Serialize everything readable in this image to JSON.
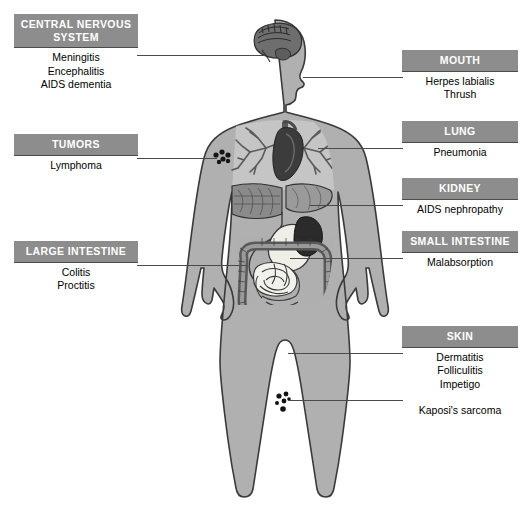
{
  "diagram": {
    "colors": {
      "header_bg": "#8d8d8d",
      "header_text": "#ffffff",
      "line": "#4a4a4a",
      "body_fill": "#b0b0b0",
      "body_outline": "#3a3a3a",
      "organ_dark": "#3c3c3c",
      "organ_mid": "#6e6e6e",
      "organ_light": "#d8d8d8",
      "background": "#ffffff"
    },
    "figure": {
      "name": "human-body-anterior-view",
      "markers": [
        {
          "name": "lymph-node-cluster",
          "label": "Lymphoma nodes",
          "region": "left axilla"
        },
        {
          "name": "kaposi-lesions",
          "label": "Kaposi's sarcoma lesions",
          "region": "right lower leg"
        }
      ],
      "organs": [
        "brain",
        "lungs",
        "bronchi",
        "heart",
        "liver",
        "stomach",
        "kidney",
        "small-intestine",
        "large-intestine",
        "bladder"
      ]
    },
    "callouts": [
      {
        "id": "cns",
        "header": "CENTRAL NERVOUS SYSTEM",
        "items": [
          "Meningitis",
          "Encephalitis",
          "AIDS dementia"
        ],
        "side": "left",
        "target": "brain"
      },
      {
        "id": "tumors",
        "header": "TUMORS",
        "items": [
          "Lymphoma"
        ],
        "side": "left",
        "target": "axillary-lymph-nodes"
      },
      {
        "id": "large-intestine",
        "header": "LARGE INTESTINE",
        "items": [
          "Colitis",
          "Proctitis"
        ],
        "side": "left",
        "target": "colon"
      },
      {
        "id": "mouth",
        "header": "MOUTH",
        "items": [
          "Herpes labialis",
          "Thrush"
        ],
        "side": "right",
        "target": "mouth"
      },
      {
        "id": "lung",
        "header": "LUNG",
        "items": [
          "Pneumonia"
        ],
        "side": "right",
        "target": "lung"
      },
      {
        "id": "kidney",
        "header": "KIDNEY",
        "items": [
          "AIDS nephropathy"
        ],
        "side": "right",
        "target": "kidney"
      },
      {
        "id": "small-intestine",
        "header": "SMALL INTESTINE",
        "items": [
          "Malabsorption"
        ],
        "side": "right",
        "target": "small-intestine"
      },
      {
        "id": "skin",
        "header": "SKIN",
        "items": [
          "Dermatitis",
          "Folliculitis",
          "Impetigo"
        ],
        "side": "right",
        "target": "thigh-skin"
      },
      {
        "id": "kaposi",
        "header": "",
        "items": [
          "Kaposi's sarcoma"
        ],
        "side": "right",
        "target": "leg-lesions"
      }
    ]
  }
}
